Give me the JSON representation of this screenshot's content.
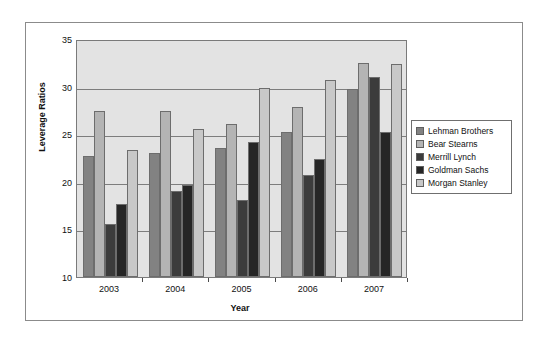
{
  "chart_data": {
    "type": "bar",
    "title": "",
    "xlabel": "Year",
    "ylabel": "Leverage Ratios",
    "categories": [
      "2003",
      "2004",
      "2005",
      "2006",
      "2007"
    ],
    "ylim": [
      10,
      35
    ],
    "yticks": [
      10,
      15,
      20,
      25,
      30,
      35
    ],
    "grid": true,
    "legend_position": "right",
    "series": [
      {
        "name": "Lehman Brothers",
        "color": "#828282",
        "values": [
          22.7,
          23.0,
          23.5,
          25.2,
          29.8
        ]
      },
      {
        "name": "Bear Stearns",
        "color": "#b4b4b4",
        "values": [
          27.4,
          27.4,
          26.1,
          27.9,
          32.5
        ]
      },
      {
        "name": "Merrill Lynch",
        "color": "#3c3c3c",
        "values": [
          15.6,
          19.0,
          18.1,
          20.7,
          31.0
        ]
      },
      {
        "name": "Goldman Sachs",
        "color": "#262626",
        "values": [
          17.7,
          19.7,
          24.2,
          22.4,
          25.2
        ]
      },
      {
        "name": "Morgan Stanley",
        "color": "#c8c8c8",
        "values": [
          23.3,
          25.5,
          29.9,
          30.7,
          32.4
        ]
      }
    ]
  },
  "plot": {
    "background_color": "#e3e3e3",
    "gridline_color": "#7d7d7d",
    "frame_color": "#8b8b8b"
  }
}
